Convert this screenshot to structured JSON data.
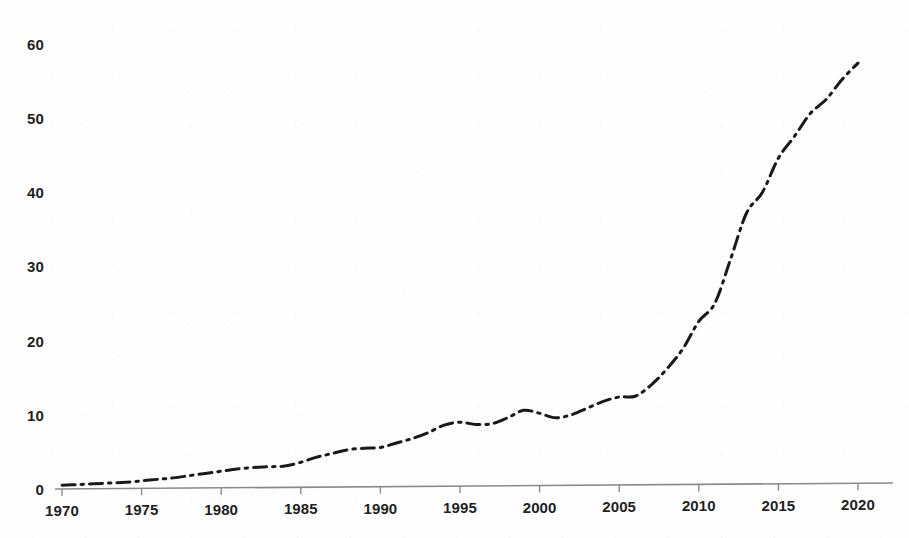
{
  "chart_data": {
    "type": "line",
    "title": "",
    "subtitle": "",
    "xlabel": "",
    "ylabel": "",
    "xlim": [
      1970,
      2021
    ],
    "ylim": [
      0,
      62
    ],
    "grid": false,
    "legend": null,
    "legend_position": "none",
    "line_style": "dash-dot",
    "line_color": "#1a1a1a",
    "line_width": 3,
    "axis_color": "#8a8a8a",
    "x_ticks": [
      1970,
      1975,
      1980,
      1985,
      1990,
      1995,
      2000,
      2005,
      2010,
      2015,
      2020
    ],
    "x_tick_labels": [
      "1970",
      "1975",
      "1980",
      "1985",
      "1990",
      "1995",
      "2000",
      "2005",
      "2010",
      "2015",
      "2020"
    ],
    "y_ticks": [
      0,
      10,
      20,
      30,
      40,
      50,
      60
    ],
    "y_tick_labels": [
      "0",
      "10",
      "20",
      "30",
      "40",
      "50",
      "60"
    ],
    "series": [
      {
        "name": "value",
        "x": [
          1970,
          1971,
          1972,
          1973,
          1974,
          1975,
          1976,
          1977,
          1978,
          1979,
          1980,
          1981,
          1982,
          1983,
          1984,
          1985,
          1986,
          1987,
          1988,
          1989,
          1990,
          1991,
          1992,
          1993,
          1994,
          1995,
          1996,
          1997,
          1998,
          1999,
          2000,
          2001,
          2002,
          2003,
          2004,
          2005,
          2006,
          2007,
          2008,
          2009,
          2010,
          2011,
          2012,
          2013,
          2014,
          2015,
          2016,
          2017,
          2018,
          2019,
          2020
        ],
        "values": [
          0.5,
          0.6,
          0.7,
          0.8,
          0.9,
          1.1,
          1.3,
          1.5,
          1.8,
          2.1,
          2.4,
          2.7,
          2.9,
          3.0,
          3.1,
          3.6,
          4.3,
          4.8,
          5.3,
          5.5,
          5.6,
          6.2,
          6.8,
          7.6,
          8.6,
          9.0,
          8.7,
          8.8,
          9.6,
          10.6,
          10.2,
          9.6,
          10.0,
          10.9,
          11.8,
          12.4,
          12.5,
          14.0,
          16.2,
          18.9,
          22.6,
          25.0,
          31.0,
          37.2,
          40.0,
          44.6,
          47.5,
          50.6,
          52.5,
          55.2,
          57.4
        ]
      }
    ],
    "annotations": []
  },
  "axes": {
    "x_axis_name": "year-axis",
    "y_axis_name": "value-axis"
  }
}
